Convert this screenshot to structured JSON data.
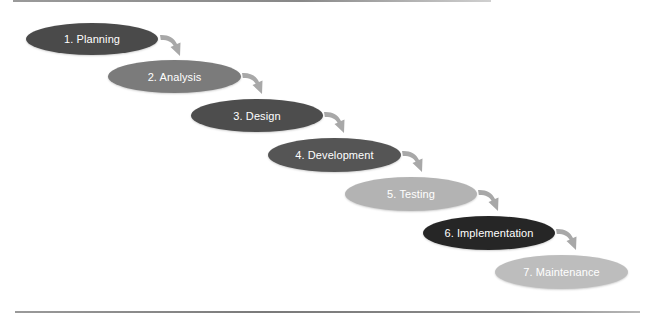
{
  "diagram": {
    "title": "",
    "stages": [
      {
        "label": "1. Planning",
        "color": "#4a4a4a",
        "text_color": "#ffffff",
        "x": 26,
        "y": 23,
        "w": 132,
        "h": 32
      },
      {
        "label": "2. Analysis",
        "color": "#7b7b7b",
        "text_color": "#ffffff",
        "x": 108,
        "y": 60,
        "w": 133,
        "h": 33
      },
      {
        "label": "3. Design",
        "color": "#4d4d4d",
        "text_color": "#ffffff",
        "x": 191,
        "y": 99,
        "w": 132,
        "h": 33
      },
      {
        "label": "4. Development",
        "color": "#555555",
        "text_color": "#ffffff",
        "x": 268,
        "y": 138,
        "w": 133,
        "h": 34
      },
      {
        "label": "5. Testing",
        "color": "#b3b3b3",
        "text_color": "#ffffff",
        "x": 345,
        "y": 177,
        "w": 132,
        "h": 34
      },
      {
        "label": "6. Implementation",
        "color": "#262626",
        "text_color": "#ffffff",
        "x": 423,
        "y": 216,
        "w": 132,
        "h": 34
      },
      {
        "label": "7. Maintenance",
        "color": "#bdbdbd",
        "text_color": "#ffffff",
        "x": 495,
        "y": 255,
        "w": 133,
        "h": 34
      }
    ],
    "arrows": [
      {
        "from": 1,
        "to": 2,
        "x": 159,
        "y": 33
      },
      {
        "from": 2,
        "to": 3,
        "x": 241,
        "y": 71
      },
      {
        "from": 3,
        "to": 4,
        "x": 323,
        "y": 110
      },
      {
        "from": 4,
        "to": 5,
        "x": 401,
        "y": 149
      },
      {
        "from": 5,
        "to": 6,
        "x": 477,
        "y": 188
      },
      {
        "from": 6,
        "to": 7,
        "x": 555,
        "y": 227
      }
    ],
    "arrow_color": "#a8a8a8"
  }
}
